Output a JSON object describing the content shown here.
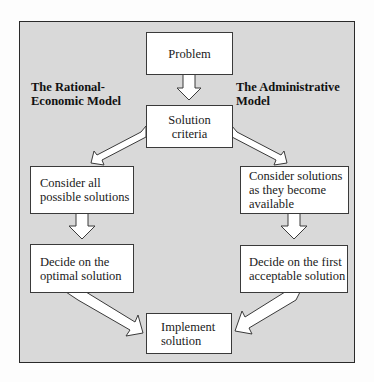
{
  "diagram": {
    "left_model_title": "The Rational-\nEconomic Model",
    "right_model_title": "The Administrative\nModel",
    "nodes": {
      "problem": "Problem",
      "solution_criteria": "Solution\ncriteria",
      "rational_step1": "Consider all\npossible solutions",
      "rational_step2": "Decide on the\noptimal solution",
      "admin_step1": "Consider solutions\nas they become\navailable",
      "admin_step2": "Decide on the first\nacceptable solution",
      "implement": "Implement\nsolution"
    },
    "edges": [
      {
        "from": "problem",
        "to": "solution_criteria"
      },
      {
        "from": "solution_criteria",
        "to": "rational_step1"
      },
      {
        "from": "solution_criteria",
        "to": "admin_step1"
      },
      {
        "from": "rational_step1",
        "to": "rational_step2"
      },
      {
        "from": "admin_step1",
        "to": "admin_step2"
      },
      {
        "from": "rational_step2",
        "to": "implement"
      },
      {
        "from": "admin_step2",
        "to": "implement"
      }
    ],
    "colors": {
      "background": "#d9d9d9",
      "box_fill": "#ffffff",
      "stroke": "#2a2a2a"
    }
  }
}
